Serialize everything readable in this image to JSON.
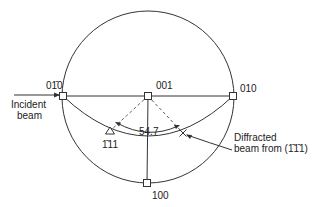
{
  "diagram": {
    "type": "stereographic-projection",
    "poles": [
      {
        "id": "pole-0-1bar-0",
        "label": "01̄0",
        "x": 63,
        "y": 96,
        "marker": "square"
      },
      {
        "id": "pole-001",
        "label": "001",
        "x": 148,
        "y": 96,
        "marker": "square"
      },
      {
        "id": "pole-010",
        "label": "010",
        "x": 233,
        "y": 96,
        "marker": "square"
      },
      {
        "id": "pole-100",
        "label": "100",
        "x": 147,
        "y": 183,
        "marker": "square"
      },
      {
        "id": "pole-1bar-11",
        "label": "1̄11",
        "x": 110,
        "y": 131,
        "marker": "triangle"
      },
      {
        "id": "diffracted-spot",
        "label": "",
        "x": 183,
        "y": 133,
        "marker": "cross"
      }
    ],
    "labels": {
      "incident_beam_line1": "Incident",
      "incident_beam_line2": "beam",
      "diffracted_line1": "Diffracted",
      "diffracted_line2": "beam from (1̄1̄1)",
      "angle": "54.7",
      "p_0bar10": "01̄0",
      "p_001": "001",
      "p_010": "010",
      "p_100": "100",
      "p_1bar11": "1̄11"
    },
    "angle_value_deg": 54.7,
    "colors": {
      "line": "#333333",
      "text": "#222222",
      "background": "#ffffff"
    }
  }
}
